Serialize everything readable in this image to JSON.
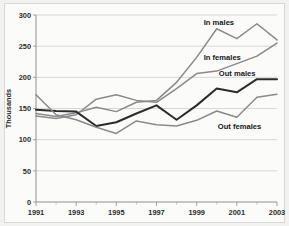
{
  "chart_data": {
    "type": "line",
    "title": "",
    "subtitle": "",
    "xlabel": "",
    "ylabel": "Thousands",
    "x": [
      1991,
      1992,
      1993,
      1994,
      1995,
      1996,
      1997,
      1998,
      1999,
      2000,
      2001,
      2002,
      2003
    ],
    "xlim": [
      1991,
      2003
    ],
    "ylim": [
      0,
      300
    ],
    "ytick_labels": [
      "0",
      "50",
      "100",
      "150",
      "200",
      "250",
      "300"
    ],
    "ytick_values": [
      0,
      50,
      100,
      150,
      200,
      250,
      300
    ],
    "xtick_labels": [
      "1991",
      "1993",
      "1995",
      "1997",
      "1999",
      "2001",
      "2003"
    ],
    "xtick_values": [
      1991,
      1993,
      1995,
      1997,
      1999,
      2001,
      2003
    ],
    "xminor_tick_values": [
      1992,
      1994,
      1996,
      1998,
      2000,
      2002
    ],
    "grid": "horizontal",
    "legend_position": "inline-annotations",
    "series": [
      {
        "name": "In males",
        "color": "#8a8a8a",
        "label_x": 1999.35,
        "label_y": 288,
        "values": [
          142,
          137,
          143,
          152,
          145,
          160,
          163,
          192,
          232,
          278,
          262,
          286,
          260
        ]
      },
      {
        "name": "In females",
        "color": "#8a8a8a",
        "label_x": 1999.35,
        "label_y": 233,
        "values": [
          138,
          134,
          140,
          165,
          172,
          163,
          160,
          182,
          206,
          210,
          222,
          234,
          255
        ]
      },
      {
        "name": "Out males",
        "color": "#2c2c2c",
        "label_x": 2000.1,
        "label_y": 207,
        "values": [
          148,
          146,
          145,
          122,
          128,
          142,
          155,
          132,
          155,
          182,
          176,
          197,
          197
        ]
      },
      {
        "name": "Out females",
        "color": "#8a8a8a",
        "label_x": 2000.05,
        "label_y": 122,
        "values": [
          172,
          140,
          132,
          120,
          110,
          130,
          124,
          122,
          131,
          146,
          136,
          168,
          173
        ]
      }
    ]
  }
}
